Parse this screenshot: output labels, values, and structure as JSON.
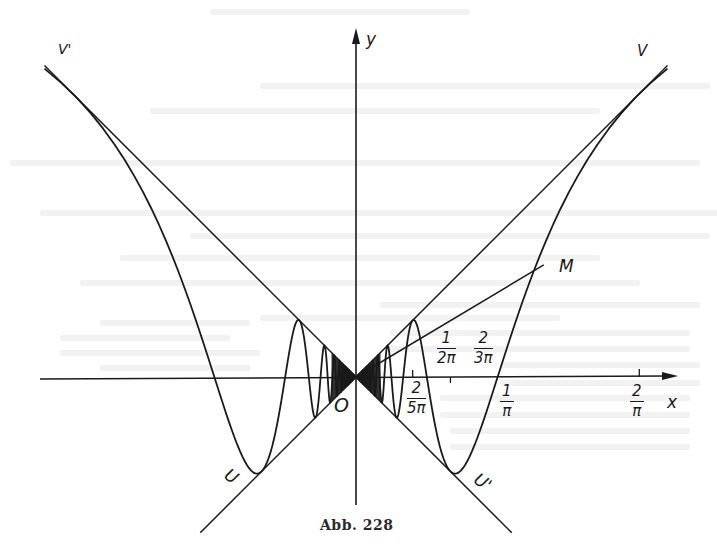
{
  "figure": {
    "caption": "Abb. 228",
    "function": "y = x sin(1/x)",
    "axes": {
      "x_label": "x",
      "y_label": "y",
      "origin_label": "O"
    },
    "point_labels": {
      "V_left": "V'",
      "V_right": "V",
      "U_left": "U",
      "U_right": "U'",
      "M": "M"
    },
    "tick_labels": [
      {
        "id": "t_1_2pi",
        "num": "1",
        "den": "2π",
        "value": 0.1592
      },
      {
        "id": "t_2_3pi",
        "num": "2",
        "den": "3π",
        "value": 0.2122
      },
      {
        "id": "t_2_5pi",
        "num": "2",
        "den": "5π",
        "value": 0.1273
      },
      {
        "id": "t_1_pi",
        "num": "1",
        "den": "π",
        "value": 0.3183
      },
      {
        "id": "t_2_pi",
        "num": "2",
        "den": "π",
        "value": 0.6366
      }
    ]
  },
  "chart_data": {
    "type": "line",
    "title": "Abb. 228",
    "xlabel": "x",
    "ylabel": "y",
    "xlim": [
      -0.72,
      0.72
    ],
    "ylim": [
      -0.3,
      0.78
    ],
    "series": [
      {
        "name": "y = x·sin(1/x)",
        "domain": [
          -0.7,
          0.7
        ]
      },
      {
        "name": "y = x (envelope)",
        "points": [
          [
            -0.35,
            -0.35
          ],
          [
            0.7,
            0.7
          ]
        ]
      },
      {
        "name": "y = -x (envelope)",
        "points": [
          [
            -0.7,
            0.7
          ],
          [
            0.35,
            -0.35
          ]
        ]
      },
      {
        "name": "secant O–M",
        "points": [
          [
            0,
            0
          ],
          [
            0.422,
            0.252
          ]
        ]
      }
    ],
    "x_ticks": [
      "2/(5π)",
      "1/(2π)",
      "2/(3π)",
      "1/π",
      "2/π"
    ],
    "annotations": [
      "V'",
      "V",
      "U",
      "U'",
      "M",
      "O"
    ]
  },
  "colors": {
    "ink": "#1a1a1a",
    "paper": "#ffffff",
    "bleed": "#ececec"
  }
}
